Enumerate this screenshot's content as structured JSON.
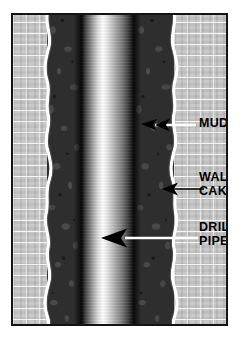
{
  "figure": {
    "type": "cross-section-diagram",
    "frame": {
      "border_color": "#141414",
      "background_color": "#ffffff"
    }
  },
  "layers": [
    {
      "id": "formation-left",
      "name": "Formation rock",
      "texture": "brick-hatch",
      "color": "#c9c9c9",
      "side": "left"
    },
    {
      "id": "wall-cake-left",
      "name": "Wall cake",
      "texture": "wavy-film",
      "color": "#ffffff",
      "side": "left"
    },
    {
      "id": "mud-left",
      "name": "Mud",
      "texture": "pebble",
      "color": "#2e2e2e",
      "side": "left"
    },
    {
      "id": "drill-pipe",
      "name": "Drill pipe",
      "texture": "steel-cylinder-gradient",
      "color": "#ffffff",
      "side": "center"
    },
    {
      "id": "mud-right",
      "name": "Mud",
      "texture": "pebble",
      "color": "#2e2e2e",
      "side": "right"
    },
    {
      "id": "wall-cake-right",
      "name": "Wall cake",
      "texture": "wavy-film",
      "color": "#ffffff",
      "side": "right"
    },
    {
      "id": "formation-right",
      "name": "Formation rock",
      "texture": "brick-hatch",
      "color": "#c9c9c9",
      "side": "right"
    }
  ],
  "callouts": [
    {
      "id": "mud",
      "label": "MUD",
      "arrow_direction": "left",
      "arrow_color": "#000000",
      "leader_color": "#ffffff",
      "points_to": "mud-right"
    },
    {
      "id": "wall-cake",
      "label": "WALL\nCAKE",
      "arrow_direction": "left",
      "arrow_color": "#000000",
      "leader_color": "#000000",
      "points_to": "wall-cake-right"
    },
    {
      "id": "drill-pipe",
      "label": "DRILL\nPIPE",
      "arrow_direction": "left",
      "arrow_color": "#000000",
      "leader_color": "#ffffff",
      "points_to": "drill-pipe"
    }
  ]
}
